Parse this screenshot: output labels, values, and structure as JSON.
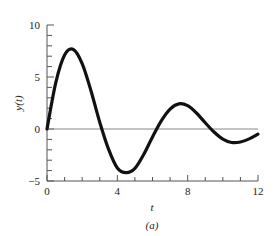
{
  "chart_data": {
    "type": "line",
    "title": "",
    "caption": "(a)",
    "xlabel": "t",
    "ylabel": "y(t)",
    "xlim": [
      0,
      12
    ],
    "ylim": [
      -5,
      10
    ],
    "x_major_ticks": [
      0,
      4,
      8,
      12
    ],
    "x_minor_step": 1,
    "y_major_ticks": [
      -5,
      0,
      5,
      10
    ],
    "y_minor_step": 1,
    "grid": false,
    "zero_line": true,
    "series": [
      {
        "name": "y(t)",
        "x": [
          0,
          0.5,
          1.0,
          1.5,
          2.0,
          2.5,
          3.0,
          3.5,
          4.0,
          4.5,
          5.0,
          5.5,
          6.0,
          6.5,
          7.0,
          7.5,
          8.0,
          8.5,
          9.0,
          9.5,
          10.0,
          10.5,
          11.0,
          11.5,
          12.0
        ],
        "values": [
          0,
          4.46,
          7.11,
          7.65,
          6.29,
          3.68,
          0.65,
          -1.94,
          -3.75,
          -4.2,
          -3.79,
          -2.45,
          -0.76,
          0.79,
          1.92,
          2.42,
          2.24,
          1.54,
          0.6,
          -0.29,
          -0.97,
          -1.3,
          -1.25,
          -0.95,
          -0.5
        ]
      }
    ]
  },
  "labels": {
    "x_axis": "t",
    "y_axis": "y(t)",
    "caption": "(a)",
    "x_ticks": [
      "0",
      "4",
      "8",
      "12"
    ],
    "y_ticks": [
      "−5",
      "0",
      "5",
      "10"
    ]
  },
  "colors": {
    "curve": "#111111",
    "axis": "#555555",
    "zero_line": "#888888",
    "text": "#222222"
  }
}
